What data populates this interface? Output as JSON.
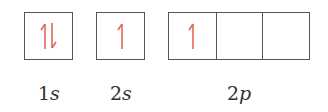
{
  "diagram": {
    "type": "orbital-box-diagram",
    "arrow_color": "#e0685a",
    "box_border_color": "#555555",
    "orbitals": [
      {
        "label_number": "1",
        "label_letter": "s",
        "boxes": [
          {
            "electrons": [
              "up",
              "down"
            ]
          }
        ]
      },
      {
        "label_number": "2",
        "label_letter": "s",
        "boxes": [
          {
            "electrons": [
              "up"
            ]
          }
        ]
      },
      {
        "label_number": "2",
        "label_letter": "p",
        "boxes": [
          {
            "electrons": [
              "up"
            ]
          },
          {
            "electrons": []
          },
          {
            "electrons": []
          }
        ]
      }
    ]
  }
}
